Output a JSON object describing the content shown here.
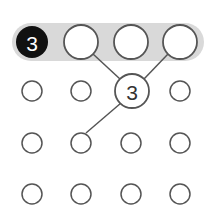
{
  "diagram": {
    "colors": {
      "band": "#d9d9d9",
      "stroke": "#555555",
      "filled": "#111111",
      "text_on_filled": "#ffffff",
      "text": "#333333"
    },
    "band": {
      "label": "highlighted-row"
    },
    "row1": [
      {
        "cx": 32,
        "cy": 42,
        "r": 16,
        "filled": true,
        "label": "3"
      },
      {
        "cx": 81,
        "cy": 42,
        "r": 17,
        "filled": false,
        "label": ""
      },
      {
        "cx": 131,
        "cy": 42,
        "r": 17,
        "filled": false,
        "label": ""
      },
      {
        "cx": 180,
        "cy": 42,
        "r": 17,
        "filled": false,
        "label": ""
      }
    ],
    "center_node": {
      "cx": 132,
      "cy": 91,
      "r": 17,
      "label": "3"
    },
    "grid_labels": {
      "black_node": "3",
      "center_node": "3"
    }
  }
}
